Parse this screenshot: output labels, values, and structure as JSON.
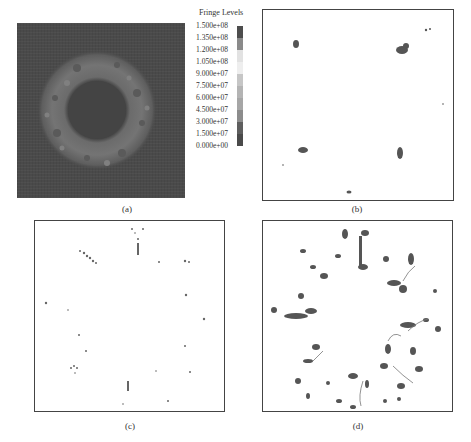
{
  "figure": {
    "panels": [
      {
        "id": "a",
        "label": "(a)",
        "description": "Fringe contour of full ring region, dark background with lighter annulus"
      },
      {
        "id": "b",
        "label": "(b)",
        "description": "Sparse dark clusters at six locations"
      },
      {
        "id": "c",
        "label": "(c)",
        "description": "Scattered small speckles distributed around a ring"
      },
      {
        "id": "d",
        "label": "(d)",
        "description": "Dense dark clusters forming a ring pattern"
      }
    ],
    "legend": {
      "title": "Fringe Levels",
      "levels": [
        "1.500e+08",
        "1.350e+08",
        "1.200e+08",
        "1.050e+08",
        "9.000e+07",
        "7.500e+07",
        "6.000e+07",
        "4.500e+07",
        "3.000e+07",
        "1.500e+07",
        "0.000e+00"
      ],
      "colors": [
        "#4d4d4d",
        "#8a8a8a",
        "#d8d8d8",
        "#eeeeee",
        "#c6c6c6",
        "#b8b8b8",
        "#a8a8a8",
        "#9a9a9a",
        "#6a6a6a",
        "#555555"
      ]
    }
  }
}
